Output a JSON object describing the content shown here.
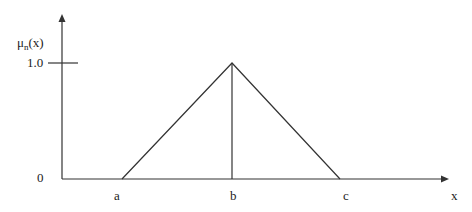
{
  "diagram": {
    "type": "triangular membership function",
    "y_axis_label": "μ",
    "y_axis_label_sub": "n",
    "y_axis_label_arg": "(x)",
    "x_axis_label": "x",
    "y_tick_top": "1.0",
    "origin_label": "0",
    "points": [
      "a",
      "b",
      "c"
    ],
    "line_color": "#333333"
  }
}
